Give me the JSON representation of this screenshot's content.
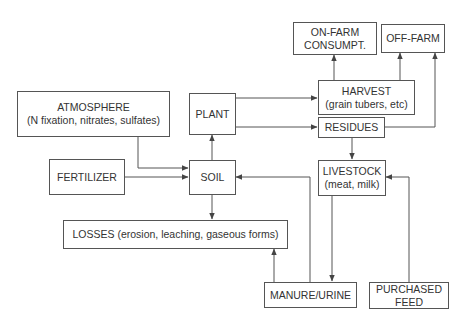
{
  "diagram": {
    "type": "flowchart",
    "nodes": {
      "atmosphere": {
        "line1": "ATMOSPHERE",
        "line2": "(N fixation, nitrates, sulfates)"
      },
      "fertilizer": {
        "line1": "FERTILIZER"
      },
      "plant": {
        "line1": "PLANT"
      },
      "soil": {
        "line1": "SOIL"
      },
      "losses": {
        "line1": "LOSSES (erosion, leaching, gaseous forms)"
      },
      "on_farm": {
        "line1": "ON-FARM",
        "line2": "CONSUMPT."
      },
      "off_farm": {
        "line1": "OFF-FARM"
      },
      "harvest": {
        "line1": "HARVEST",
        "line2": "(grain tubers, etc)"
      },
      "residues": {
        "line1": "RESIDUES"
      },
      "livestock": {
        "line1": "LIVESTOCK",
        "line2": "(meat, milk)"
      },
      "manure": {
        "line1": "MANURE/URINE"
      },
      "purchased_feed": {
        "line1": "PURCHASED",
        "line2": "FEED"
      }
    },
    "edges": [
      {
        "from": "ATMOSPHERE",
        "to": "SOIL"
      },
      {
        "from": "FERTILIZER",
        "to": "SOIL"
      },
      {
        "from": "SOIL",
        "to": "PLANT"
      },
      {
        "from": "SOIL",
        "to": "LOSSES"
      },
      {
        "from": "PLANT",
        "to": "HARVEST"
      },
      {
        "from": "PLANT",
        "to": "RESIDUES"
      },
      {
        "from": "HARVEST",
        "to": "ON-FARM CONSUMPT."
      },
      {
        "from": "HARVEST",
        "to": "OFF-FARM"
      },
      {
        "from": "RESIDUES",
        "to": "OFF-FARM"
      },
      {
        "from": "RESIDUES",
        "to": "LIVESTOCK"
      },
      {
        "from": "LIVESTOCK",
        "to": "MANURE/URINE"
      },
      {
        "from": "PURCHASED FEED",
        "to": "LIVESTOCK"
      },
      {
        "from": "MANURE/URINE",
        "to": "SOIL"
      },
      {
        "from": "MANURE/URINE",
        "to": "LOSSES"
      }
    ],
    "colors": {
      "line": "#555555",
      "text": "#333333",
      "background": "#ffffff"
    }
  }
}
